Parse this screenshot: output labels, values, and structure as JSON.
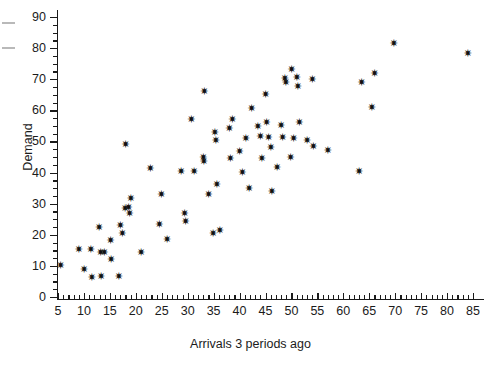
{
  "chart_data": {
    "type": "scatter",
    "title": "",
    "xlabel": "Arrivals 3 periods ago",
    "ylabel": "Demand",
    "xlim": [
      4,
      87
    ],
    "ylim": [
      0,
      93
    ],
    "grid": false,
    "legend": null,
    "marker": "star",
    "marker_color": "#111111",
    "x_major_ticks": [
      5,
      10,
      15,
      20,
      25,
      30,
      35,
      40,
      45,
      50,
      55,
      60,
      65,
      70,
      75,
      80,
      85
    ],
    "x_tick_labels": [
      "5",
      "10",
      "15",
      "20",
      "25",
      "30",
      "35",
      "40",
      "45",
      "50",
      "55",
      "60",
      "65",
      "70",
      "75",
      "80",
      "85"
    ],
    "x_minor_tick_interval": 1,
    "y_major_ticks": [
      0,
      10,
      20,
      30,
      40,
      50,
      60,
      70,
      80,
      90
    ],
    "y_tick_labels": [
      "0",
      "10",
      "20",
      "30",
      "40",
      "50",
      "60",
      "70",
      "80",
      "90"
    ],
    "y_minor_tick_interval": 2.5,
    "points": [
      {
        "x": 5.5,
        "y": 10.0
      },
      {
        "x": 9.0,
        "y": 15.4
      },
      {
        "x": 10.0,
        "y": 9.0
      },
      {
        "x": 11.3,
        "y": 15.4
      },
      {
        "x": 11.5,
        "y": 6.3
      },
      {
        "x": 12.9,
        "y": 22.3
      },
      {
        "x": 13.2,
        "y": 14.2
      },
      {
        "x": 13.3,
        "y": 6.6
      },
      {
        "x": 13.9,
        "y": 14.2
      },
      {
        "x": 15.1,
        "y": 18.3
      },
      {
        "x": 15.2,
        "y": 12.1
      },
      {
        "x": 16.7,
        "y": 6.5
      },
      {
        "x": 17.0,
        "y": 23.1
      },
      {
        "x": 17.4,
        "y": 20.3
      },
      {
        "x": 17.9,
        "y": 28.5
      },
      {
        "x": 18.0,
        "y": 49.0
      },
      {
        "x": 18.6,
        "y": 28.8
      },
      {
        "x": 18.8,
        "y": 26.8
      },
      {
        "x": 19.0,
        "y": 31.8
      },
      {
        "x": 21.0,
        "y": 14.2
      },
      {
        "x": 22.8,
        "y": 41.3
      },
      {
        "x": 24.5,
        "y": 23.2
      },
      {
        "x": 24.9,
        "y": 32.8
      },
      {
        "x": 26.0,
        "y": 18.4
      },
      {
        "x": 28.7,
        "y": 40.3
      },
      {
        "x": 29.4,
        "y": 27.0
      },
      {
        "x": 29.6,
        "y": 24.2
      },
      {
        "x": 30.7,
        "y": 56.9
      },
      {
        "x": 31.2,
        "y": 40.2
      },
      {
        "x": 33.0,
        "y": 44.8
      },
      {
        "x": 33.1,
        "y": 43.4
      },
      {
        "x": 33.2,
        "y": 66.2
      },
      {
        "x": 34.0,
        "y": 33.0
      },
      {
        "x": 34.9,
        "y": 20.3
      },
      {
        "x": 35.2,
        "y": 53.0
      },
      {
        "x": 35.4,
        "y": 50.3
      },
      {
        "x": 35.6,
        "y": 36.2
      },
      {
        "x": 36.2,
        "y": 21.5
      },
      {
        "x": 38.0,
        "y": 54.2
      },
      {
        "x": 38.2,
        "y": 44.5
      },
      {
        "x": 38.6,
        "y": 57.0
      },
      {
        "x": 40.0,
        "y": 46.8
      },
      {
        "x": 40.5,
        "y": 40.1
      },
      {
        "x": 41.2,
        "y": 51.0
      },
      {
        "x": 41.8,
        "y": 35.0
      },
      {
        "x": 42.3,
        "y": 60.5
      },
      {
        "x": 43.5,
        "y": 54.8
      },
      {
        "x": 44.0,
        "y": 51.5
      },
      {
        "x": 44.3,
        "y": 44.6
      },
      {
        "x": 45.0,
        "y": 65.0
      },
      {
        "x": 45.2,
        "y": 56.0
      },
      {
        "x": 45.6,
        "y": 51.2
      },
      {
        "x": 46.0,
        "y": 48.0
      },
      {
        "x": 46.2,
        "y": 33.8
      },
      {
        "x": 47.2,
        "y": 41.6
      },
      {
        "x": 48.0,
        "y": 55.2
      },
      {
        "x": 48.3,
        "y": 51.2
      },
      {
        "x": 48.7,
        "y": 70.2
      },
      {
        "x": 48.9,
        "y": 68.9
      },
      {
        "x": 49.8,
        "y": 44.7
      },
      {
        "x": 50.0,
        "y": 73.0
      },
      {
        "x": 50.4,
        "y": 51.0
      },
      {
        "x": 51.0,
        "y": 70.5
      },
      {
        "x": 51.2,
        "y": 67.8
      },
      {
        "x": 51.5,
        "y": 56.0
      },
      {
        "x": 53.0,
        "y": 50.4
      },
      {
        "x": 54.0,
        "y": 70.0
      },
      {
        "x": 54.2,
        "y": 48.3
      },
      {
        "x": 57.0,
        "y": 47.0
      },
      {
        "x": 63.0,
        "y": 40.2
      },
      {
        "x": 63.5,
        "y": 69.0
      },
      {
        "x": 65.5,
        "y": 60.9
      },
      {
        "x": 66.0,
        "y": 72.0
      },
      {
        "x": 69.7,
        "y": 81.5
      },
      {
        "x": 84.0,
        "y": 78.3
      }
    ]
  },
  "figure": {
    "background_color": "#ffffff",
    "axis_color": "#1a1a1a",
    "text_color": "#1b1b1b"
  }
}
